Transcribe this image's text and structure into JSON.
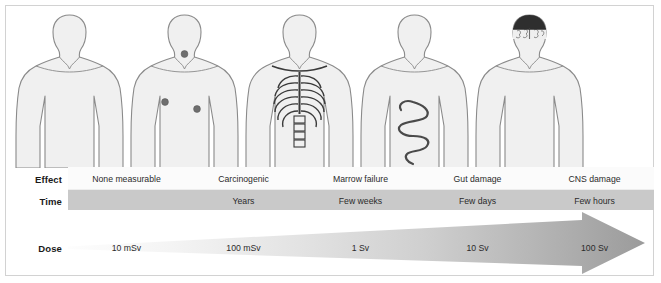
{
  "diagram": {
    "row_labels": {
      "effect": "Effect",
      "time": "Time",
      "dose": "Dose"
    },
    "columns": [
      {
        "effect": "None measurable",
        "time": "",
        "dose": "10 mSv",
        "figure": "human-body-plain"
      },
      {
        "effect": "Carcinogenic",
        "time": "Years",
        "dose": "100 mSv",
        "figure": "human-body-tumours"
      },
      {
        "effect": "Marrow failure",
        "time": "Few weeks",
        "dose": "1 Sv",
        "figure": "human-body-ribcage"
      },
      {
        "effect": "Gut damage",
        "time": "Few days",
        "dose": "10 Sv",
        "figure": "human-body-intestines"
      },
      {
        "effect": "CNS damage",
        "time": "Few hours",
        "dose": "100 Sv",
        "figure": "human-body-brain"
      }
    ],
    "colors": {
      "body_fill": "#f0f0f0",
      "body_outline": "#8a8a8a",
      "tumour_dot": "#6e6e6e",
      "time_band": "#c9c9c9",
      "effect_band": "#fbfbfb",
      "arrow_start": "#fcfcfc",
      "arrow_end": "#9b9b9b",
      "frame_border": "#d2d2d2",
      "text": "#2b2b2b"
    }
  }
}
